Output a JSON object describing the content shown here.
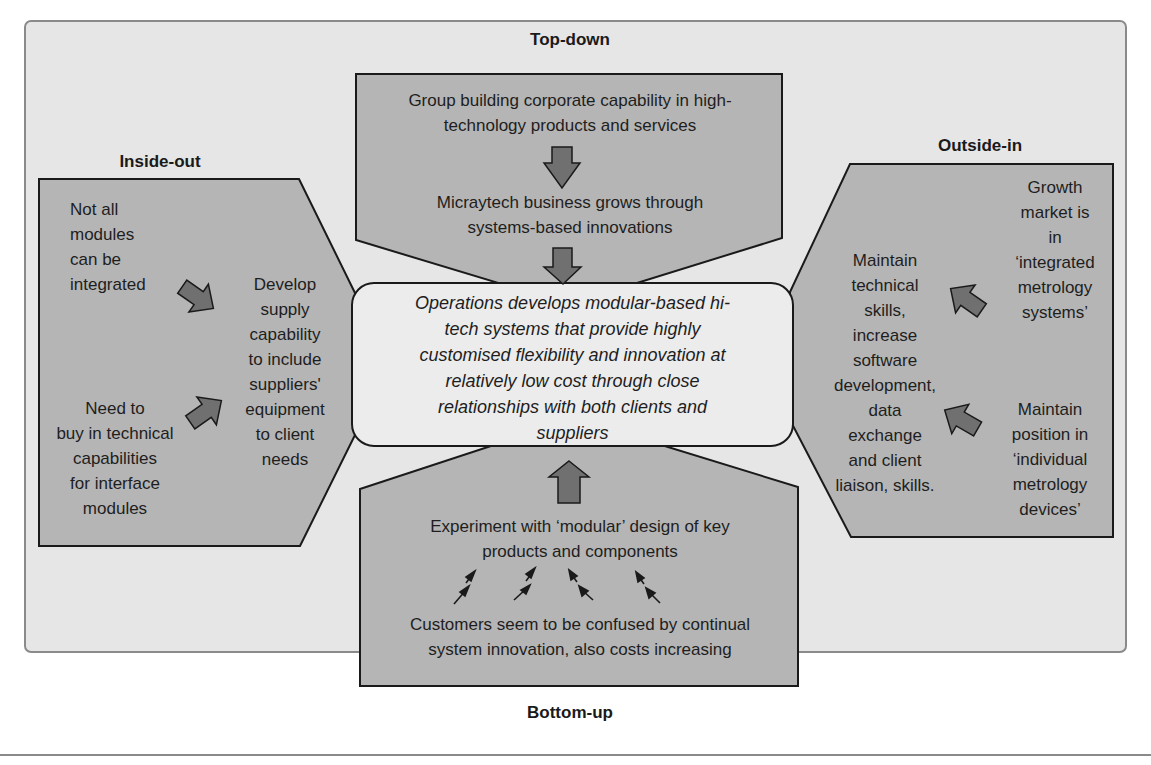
{
  "labels": {
    "top": "Top-down",
    "left": "Inside-out",
    "right": "Outside-in",
    "bottom": "Bottom-up"
  },
  "top_down": {
    "line1": "Group building corporate capability in high-",
    "line2": "technology products and services",
    "line3": "Micraytech business grows through",
    "line4": "systems-based innovations"
  },
  "center": {
    "lines": [
      "Operations develops modular-based hi-",
      "tech systems that provide highly",
      "customised flexibility and innovation at",
      "relatively low cost through close",
      "relationships with both clients and",
      "suppliers"
    ]
  },
  "inside_out": {
    "item1": [
      "Not all",
      "modules",
      "can be",
      "integrated"
    ],
    "item2": [
      "Need to",
      "buy in technical",
      "capabilities",
      "for interface",
      "modules"
    ],
    "result": [
      "Develop",
      "supply",
      "capability",
      "to include",
      "suppliers'",
      "equipment",
      "to client",
      "needs"
    ]
  },
  "outside_in": {
    "item1": [
      "Growth",
      "market is",
      "in",
      "‘integrated",
      "metrology",
      "systems’"
    ],
    "item2": [
      "Maintain",
      "position in",
      "‘individual",
      "metrology",
      "devices’"
    ],
    "result": [
      "Maintain",
      "technical",
      "skills,",
      "increase",
      "software",
      "development,",
      "data",
      "exchange",
      "and client",
      "liaison, skills."
    ]
  },
  "bottom_up": {
    "line1": "Experiment with ‘modular’ design of key",
    "line2": "products and components",
    "line3": "Customers seem to be confused by continual",
    "line4": "system innovation, also costs increasing"
  },
  "colors": {
    "frame_bg": "#e6e6e6",
    "shape_fill": "#b5b5b5",
    "center_fill": "#ececec",
    "arrow_fill": "#707070",
    "stroke": "#1a1a1a"
  }
}
